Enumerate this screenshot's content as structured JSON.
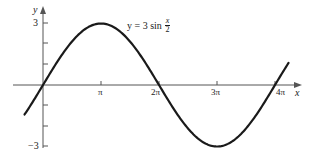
{
  "chart_data": {
    "type": "line",
    "title": "",
    "equation": {
      "lhs": "y",
      "equals": "=",
      "coefficient": "3",
      "func": "sin",
      "numerator": "x",
      "denominator": "2"
    },
    "xlabel": "x",
    "ylabel": "y",
    "x_ticks": [
      "π",
      "2π",
      "3π",
      "4π"
    ],
    "x_tick_values": [
      3.14159,
      6.28319,
      9.42478,
      12.56637
    ],
    "y_ticks": [
      "3",
      "",
      "",
      "",
      "",
      "-3"
    ],
    "y_tick_values": [
      3,
      2,
      1,
      -1,
      -2,
      3
    ],
    "y_tick_labels_shown": {
      "3": "3",
      "-3": "−3"
    },
    "xlim": [
      -1.6,
      13.6
    ],
    "ylim": [
      -3.2,
      3.8
    ],
    "grid": false,
    "legend": null,
    "series": [
      {
        "name": "y = 3 sin(x/2)",
        "x": [
          -1.0,
          0,
          1.5708,
          3.1416,
          4.7124,
          6.2832,
          7.854,
          9.4248,
          10.9956,
          12.5664,
          13.3
        ],
        "values": [
          -1.44,
          0,
          2.12,
          3,
          2.12,
          0,
          -2.12,
          -3,
          -2.12,
          0,
          1.07
        ]
      }
    ]
  },
  "labels": {
    "y_axis": "y",
    "x_axis": "x",
    "tick_pi": "π",
    "tick_2pi": "2π",
    "tick_3pi": "3π",
    "tick_4pi": "4π",
    "tick_3": "3",
    "tick_neg3": "−3",
    "eq_lhs": "y = 3 sin",
    "eq_num": "x",
    "eq_den": "2"
  }
}
